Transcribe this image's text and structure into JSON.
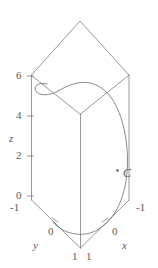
{
  "figure": {
    "name": "3d-space-curve-in-box",
    "stroke_color": "#6b6b6b",
    "text_color": "#5a5a5a",
    "background_color": "#ffffff"
  },
  "axes": {
    "z": {
      "label": "z",
      "ticks": [
        "6",
        "4",
        "2",
        "0"
      ]
    },
    "y": {
      "label": "y",
      "ticks": [
        "-1",
        "0",
        "1"
      ]
    },
    "x": {
      "label": "x",
      "ticks": [
        "1",
        "0",
        "-1"
      ]
    }
  },
  "curve": {
    "label": "C"
  }
}
